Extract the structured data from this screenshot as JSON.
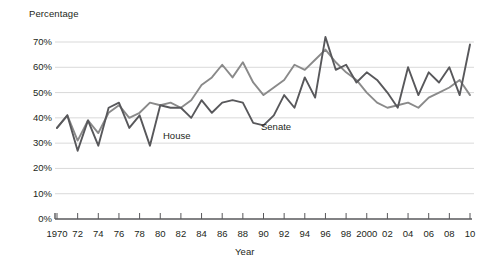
{
  "chart_data": {
    "type": "line",
    "title": "",
    "xlabel": "Year",
    "ylabel": "Percentage",
    "ylim": [
      0,
      75
    ],
    "xlim": [
      1970,
      2010
    ],
    "grid": true,
    "legend_position": "inline-annotations",
    "ytick_labels": [
      "0%",
      "10%",
      "20%",
      "30%",
      "40%",
      "50%",
      "60%",
      "70%"
    ],
    "ytick_values": [
      0,
      10,
      20,
      30,
      40,
      50,
      60,
      70
    ],
    "xtick_labels": [
      "1970",
      "72",
      "74",
      "76",
      "78",
      "80",
      "82",
      "84",
      "86",
      "88",
      "90",
      "92",
      "94",
      "96",
      "98",
      "2000",
      "02",
      "04",
      "06",
      "08",
      "10"
    ],
    "xtick_values": [
      1970,
      1972,
      1974,
      1976,
      1978,
      1980,
      1982,
      1984,
      1986,
      1988,
      1990,
      1992,
      1994,
      1996,
      1998,
      2000,
      2002,
      2004,
      2006,
      2008,
      2010
    ],
    "x": [
      1970,
      1971,
      1972,
      1973,
      1974,
      1975,
      1976,
      1977,
      1978,
      1979,
      1980,
      1981,
      1982,
      1983,
      1984,
      1985,
      1986,
      1987,
      1988,
      1989,
      1990,
      1991,
      1992,
      1993,
      1994,
      1995,
      1996,
      1997,
      1998,
      1999,
      2000,
      2001,
      2002,
      2003,
      2004,
      2005,
      2006,
      2007,
      2008,
      2009,
      2010
    ],
    "series": [
      {
        "name": "House",
        "color": "#8a8a8a",
        "values": [
          36,
          41,
          31,
          39,
          34,
          42,
          45,
          40,
          42,
          46,
          45,
          46,
          44,
          47,
          53,
          56,
          61,
          56,
          62,
          54,
          49,
          52,
          55,
          61,
          59,
          63,
          67,
          62,
          58,
          55,
          50,
          46,
          44,
          45,
          46,
          44,
          48,
          50,
          52,
          55,
          49
        ]
      },
      {
        "name": "Senate",
        "color": "#58585b",
        "values": [
          36,
          41,
          27,
          39,
          29,
          44,
          46,
          36,
          41,
          29,
          45,
          44,
          44,
          40,
          47,
          42,
          46,
          47,
          46,
          38,
          37,
          41,
          49,
          44,
          56,
          48,
          72,
          59,
          61,
          54,
          58,
          55,
          50,
          44,
          60,
          49,
          58,
          54,
          60,
          49,
          69
        ]
      }
    ]
  }
}
